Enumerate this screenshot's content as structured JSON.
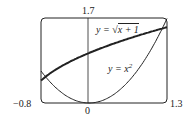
{
  "chart_data": {
    "type": "line",
    "title": "",
    "xlabel": "",
    "ylabel": "",
    "xlim": [
      -0.8,
      1.3
    ],
    "ylim": [
      0,
      1.7
    ],
    "grid": false,
    "tick_labels": {
      "x_min": "-0.8",
      "x_max": "1.3",
      "x_zero": "0",
      "y_max": "1.7"
    },
    "series": [
      {
        "name": "y = sqrt(x+1)",
        "label": "y = √(x + 1)",
        "x": [
          -0.8,
          -0.5,
          0,
          0.5,
          1,
          1.3
        ],
        "values": [
          0.447,
          0.707,
          1,
          1.225,
          1.414,
          1.517
        ]
      },
      {
        "name": "y = x^2",
        "label": "y = x²",
        "x": [
          -0.8,
          -0.5,
          0,
          0.5,
          1,
          1.3
        ],
        "values": [
          0.64,
          0.25,
          0,
          0.25,
          1,
          1.69
        ]
      }
    ],
    "annotations": [
      "y = √(x + 1)",
      "y = x²"
    ]
  },
  "labels": {
    "ymax": "1.7",
    "xmin": "−0.8",
    "xmax": "1.3",
    "zero": "0",
    "eq1_prefix": "y = ",
    "eq1_radicand": "x + 1",
    "eq2_prefix": "y = x",
    "eq2_exp": "2"
  }
}
